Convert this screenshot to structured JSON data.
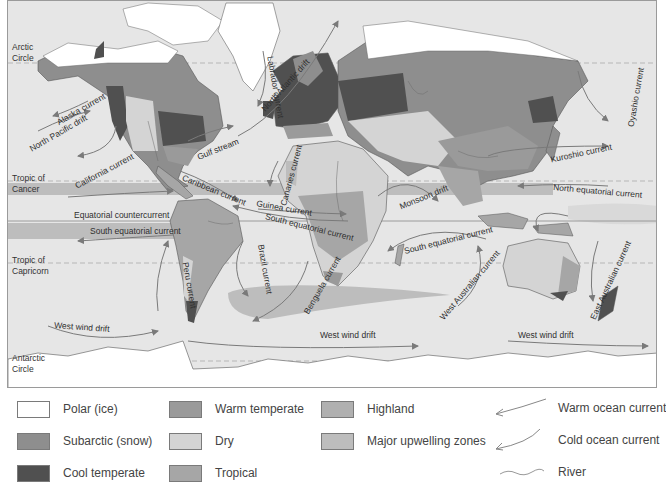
{
  "map": {
    "title": "World climate regions and ocean currents",
    "latitude_lines": [
      {
        "id": "arctic",
        "label_line1": "Arctic",
        "label_line2": "Circle"
      },
      {
        "id": "cancer",
        "label_line1": "Tropic of",
        "label_line2": "Cancer"
      },
      {
        "id": "capricorn",
        "label_line1": "Tropic of",
        "label_line2": "Capricorn"
      },
      {
        "id": "antarctic",
        "label_line1": "Antarctic",
        "label_line2": "Circle"
      }
    ],
    "current_labels": {
      "alaska": "Alaska current",
      "north_pacific": "North Pacific drift",
      "labrador": "Labrador current",
      "north_atlantic": "North Atlantic drift",
      "gulf_stream": "Gulf stream",
      "canaries": "Canaries current",
      "california": "California current",
      "caribbean": "Caribbean current",
      "guinea": "Guinea current",
      "equatorial_counter": "Equatorial countercurrent",
      "south_equatorial_pacific": "South equatorial current",
      "south_equatorial_atlantic": "South equatorial current",
      "south_equatorial_indian": "South equatorial current",
      "monsoon": "Monsoon drift",
      "kuroshio": "Kuroshio current",
      "oyashio": "Oyashio current",
      "north_equatorial": "North equatorial current",
      "peru": "Peru current",
      "brazil": "Brazil current",
      "benguela": "Benguela current",
      "west_australian": "West Australian current",
      "east_australian": "East Australian current",
      "west_wind_drift_1": "West wind drift",
      "west_wind_drift_2": "West wind drift",
      "west_wind_drift_3": "West wind drift"
    }
  },
  "legend": {
    "climate_regions": [
      {
        "label": "Polar (ice)",
        "color": "#ffffff"
      },
      {
        "label": "Subarctic (snow)",
        "color": "#8e8e8e"
      },
      {
        "label": "Cool temperate",
        "color": "#505050"
      },
      {
        "label": "Warm temperate",
        "color": "#9a9a9a"
      },
      {
        "label": "Dry",
        "color": "#d4d4d4"
      },
      {
        "label": "Tropical",
        "color": "#a6a6a6"
      },
      {
        "label": "Highland",
        "color": "#b0b0b0"
      },
      {
        "label": "Major upwelling zones",
        "color": "#bdbdbd"
      }
    ],
    "symbols": [
      {
        "label": "Warm ocean current"
      },
      {
        "label": "Cold ocean current"
      },
      {
        "label": "River"
      }
    ]
  },
  "colors": {
    "ocean": "#e6e6e6",
    "polar": "#ffffff",
    "subarctic": "#8e8e8e",
    "cool_temperate": "#505050",
    "warm_temperate": "#9a9a9a",
    "dry": "#d4d4d4",
    "tropical": "#a6a6a6",
    "upwelling": "#bdbdbd",
    "current_line": "#7a7a7a"
  }
}
